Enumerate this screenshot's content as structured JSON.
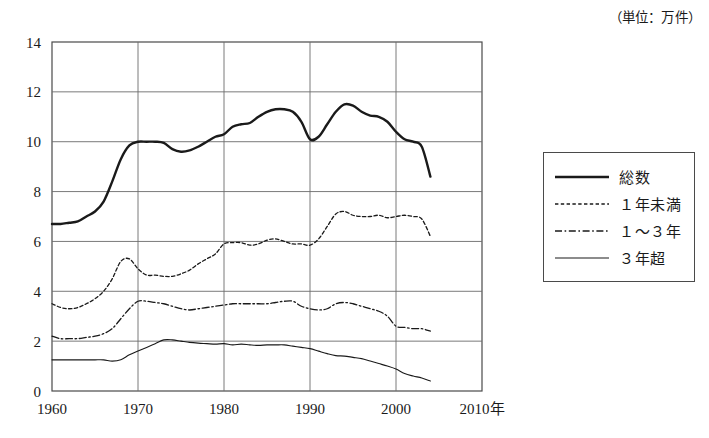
{
  "unit_note": "（単位：万件）",
  "legend": {
    "items": [
      {
        "label": "総数",
        "style": "solid-thick",
        "key": "total"
      },
      {
        "label": "１年未満",
        "style": "dotted",
        "key": "under1"
      },
      {
        "label": "１〜３年",
        "style": "dash-dot",
        "key": "y1to3"
      },
      {
        "label": "３年超",
        "style": "solid-thin",
        "key": "over3"
      }
    ]
  },
  "axes": {
    "y_ticks": [
      "0",
      "2",
      "4",
      "6",
      "8",
      "10",
      "12",
      "14"
    ],
    "x_ticks": [
      "1960",
      "1970",
      "1980",
      "1990",
      "2000",
      "2010年"
    ]
  },
  "colors": {
    "line": "#1a1a1a",
    "grid": "#6b6b6b",
    "frame": "#4a4a4a",
    "background": "#ffffff"
  },
  "chart_data": {
    "type": "line",
    "title": "",
    "subtitle": "",
    "xlabel": "年",
    "ylabel": "",
    "unit": "万件",
    "xlim": [
      1960,
      2010
    ],
    "ylim": [
      0,
      14
    ],
    "y_ticks": [
      0,
      2,
      4,
      6,
      8,
      10,
      12,
      14
    ],
    "x_ticks": [
      1960,
      1970,
      1980,
      1990,
      2000,
      2010
    ],
    "grid": true,
    "legend_position": "right-outside",
    "x": [
      1960,
      1961,
      1962,
      1963,
      1964,
      1965,
      1966,
      1967,
      1968,
      1969,
      1970,
      1971,
      1972,
      1973,
      1974,
      1975,
      1976,
      1977,
      1978,
      1979,
      1980,
      1981,
      1982,
      1983,
      1984,
      1985,
      1986,
      1987,
      1988,
      1989,
      1990,
      1991,
      1992,
      1993,
      1994,
      1995,
      1996,
      1997,
      1998,
      1999,
      2000,
      2001,
      2002,
      2003,
      2004
    ],
    "series": [
      {
        "name": "総数",
        "style": "solid-thick",
        "values": [
          6.7,
          6.7,
          6.75,
          6.8,
          7.0,
          7.2,
          7.6,
          8.4,
          9.3,
          9.85,
          10.0,
          10.0,
          10.0,
          9.95,
          9.7,
          9.6,
          9.65,
          9.8,
          10.0,
          10.2,
          10.3,
          10.6,
          10.7,
          10.75,
          11.0,
          11.2,
          11.3,
          11.3,
          11.2,
          10.8,
          10.1,
          10.2,
          10.7,
          11.2,
          11.5,
          11.45,
          11.2,
          11.05,
          11.0,
          10.8,
          10.4,
          10.1,
          10.0,
          9.8,
          8.6
        ]
      },
      {
        "name": "１年未満",
        "style": "dotted",
        "values": [
          3.5,
          3.35,
          3.3,
          3.35,
          3.5,
          3.7,
          4.0,
          4.5,
          5.2,
          5.3,
          4.9,
          4.65,
          4.65,
          4.6,
          4.6,
          4.7,
          4.85,
          5.1,
          5.3,
          5.5,
          5.9,
          5.95,
          5.95,
          5.85,
          5.9,
          6.05,
          6.1,
          6.0,
          5.9,
          5.9,
          5.85,
          6.1,
          6.6,
          7.1,
          7.2,
          7.05,
          7.0,
          7.0,
          7.05,
          6.95,
          7.0,
          7.05,
          7.0,
          6.9,
          6.2
        ]
      },
      {
        "name": "１〜３年",
        "style": "dash-dot",
        "values": [
          2.2,
          2.1,
          2.1,
          2.1,
          2.15,
          2.2,
          2.3,
          2.5,
          2.9,
          3.3,
          3.6,
          3.6,
          3.55,
          3.5,
          3.4,
          3.3,
          3.25,
          3.3,
          3.35,
          3.4,
          3.45,
          3.5,
          3.5,
          3.5,
          3.5,
          3.5,
          3.55,
          3.6,
          3.6,
          3.4,
          3.3,
          3.25,
          3.3,
          3.5,
          3.55,
          3.5,
          3.4,
          3.3,
          3.2,
          3.0,
          2.6,
          2.55,
          2.5,
          2.5,
          2.4
        ]
      },
      {
        "name": "３年超",
        "style": "solid-thin",
        "values": [
          1.25,
          1.25,
          1.25,
          1.25,
          1.25,
          1.25,
          1.25,
          1.2,
          1.25,
          1.45,
          1.6,
          1.75,
          1.9,
          2.05,
          2.05,
          2.0,
          1.95,
          1.92,
          1.9,
          1.88,
          1.9,
          1.85,
          1.88,
          1.85,
          1.83,
          1.85,
          1.85,
          1.85,
          1.8,
          1.75,
          1.7,
          1.6,
          1.5,
          1.42,
          1.4,
          1.35,
          1.3,
          1.2,
          1.1,
          1.0,
          0.88,
          0.7,
          0.6,
          0.52,
          0.4
        ]
      }
    ]
  }
}
